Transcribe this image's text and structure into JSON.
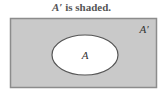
{
  "title": {
    "set_label": "A′",
    "suffix": " is shaded."
  },
  "diagram": {
    "universe": {
      "x": 10,
      "y": 18,
      "width": 147,
      "height": 70,
      "fill": "#c8c8c8",
      "stroke": "#8a8a8a"
    },
    "set_a": {
      "cx": 85,
      "cy": 55,
      "rx": 33,
      "ry": 20,
      "fill": "#ffffff",
      "stroke": "#555555",
      "label": "A"
    },
    "complement_label": "A′"
  }
}
